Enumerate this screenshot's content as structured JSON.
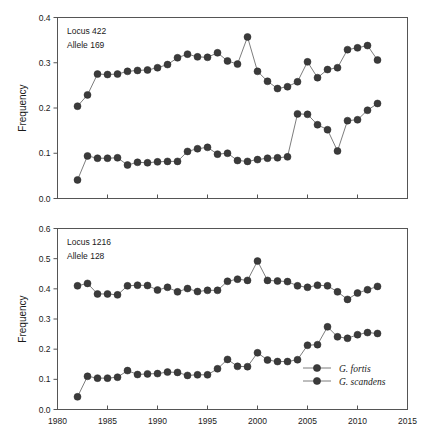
{
  "figure": {
    "background": "#ffffff",
    "marker_color": "#3b3b3b",
    "line_color": "#6e6e6e",
    "axis_color": "#555555"
  },
  "chart_data": [
    {
      "type": "line",
      "panel": "top",
      "title": "",
      "annotation_line1": "Locus 422",
      "annotation_line2": "Allele 169",
      "xlabel": "",
      "ylabel": "Frequency",
      "xlim": [
        1980,
        2015
      ],
      "ylim": [
        0.0,
        0.4
      ],
      "xticks": [
        1980,
        1985,
        1990,
        1995,
        2000,
        2005,
        2010,
        2015
      ],
      "xticklabels": [
        "1980",
        "1985",
        "1990",
        "1995",
        "2000",
        "2005",
        "2010",
        "2015"
      ],
      "yticks": [
        0.0,
        0.1,
        0.2,
        0.3,
        0.4
      ],
      "yticklabels": [
        "0.0",
        "0.1",
        "0.2",
        "0.3",
        "0.4"
      ],
      "grid": false,
      "legend": null,
      "x": [
        1982,
        1983,
        1984,
        1985,
        1986,
        1987,
        1988,
        1989,
        1990,
        1991,
        1992,
        1993,
        1994,
        1995,
        1996,
        1997,
        1998,
        1999,
        2000,
        2001,
        2002,
        2003,
        2004,
        2005,
        2006,
        2007,
        2008,
        2009,
        2010,
        2011,
        2012
      ],
      "series": [
        {
          "name": "G. fortis",
          "values": [
            0.204,
            0.229,
            0.275,
            0.274,
            0.275,
            0.281,
            0.283,
            0.284,
            0.289,
            0.296,
            0.311,
            0.319,
            0.313,
            0.312,
            0.322,
            0.304,
            0.297,
            0.357,
            0.281,
            0.259,
            0.243,
            0.247,
            0.258,
            0.302,
            0.267,
            0.285,
            0.289,
            0.329,
            0.333,
            0.338,
            0.306,
            0.272,
            0.271,
            0.279
          ]
        },
        {
          "name": "G. scandens",
          "values": [
            0.041,
            0.094,
            0.089,
            0.089,
            0.09,
            0.074,
            0.08,
            0.079,
            0.081,
            0.082,
            0.082,
            0.104,
            0.11,
            0.113,
            0.098,
            0.1,
            0.084,
            0.082,
            0.086,
            0.089,
            0.09,
            0.092,
            0.187,
            0.186,
            0.163,
            0.152,
            0.105,
            0.172,
            0.174,
            0.195,
            0.21,
            0.219,
            0.221,
            0.194,
            0.173
          ]
        }
      ]
    },
    {
      "type": "line",
      "panel": "bottom",
      "title": "",
      "annotation_line1": "Locus 1216",
      "annotation_line2": "Allele 128",
      "xlabel": "",
      "ylabel": "Frequency",
      "xlim": [
        1980,
        2015
      ],
      "ylim": [
        0.0,
        0.6
      ],
      "xticks": [
        1980,
        1985,
        1990,
        1995,
        2000,
        2005,
        2010,
        2015
      ],
      "xticklabels": [
        "1980",
        "1985",
        "1990",
        "1995",
        "2000",
        "2005",
        "2010",
        "2015"
      ],
      "yticks": [
        0.0,
        0.1,
        0.2,
        0.3,
        0.4,
        0.5,
        0.6
      ],
      "yticklabels": [
        "0.0",
        "0.1",
        "0.2",
        "0.3",
        "0.4",
        "0.5",
        "0.6"
      ],
      "grid": false,
      "legend": {
        "position": "lower-right",
        "entries": [
          "G. fortis",
          "G. scandens"
        ]
      },
      "x": [
        1982,
        1983,
        1984,
        1985,
        1986,
        1987,
        1988,
        1989,
        1990,
        1991,
        1992,
        1993,
        1994,
        1995,
        1996,
        1997,
        1998,
        1999,
        2000,
        2001,
        2002,
        2003,
        2004,
        2005,
        2006,
        2007,
        2008,
        2009,
        2010,
        2011,
        2012
      ],
      "series": [
        {
          "name": "G. fortis",
          "values": [
            0.41,
            0.418,
            0.383,
            0.383,
            0.38,
            0.41,
            0.412,
            0.411,
            0.396,
            0.405,
            0.39,
            0.401,
            0.391,
            0.395,
            0.395,
            0.425,
            0.432,
            0.428,
            0.492,
            0.428,
            0.426,
            0.424,
            0.41,
            0.405,
            0.412,
            0.41,
            0.39,
            0.365,
            0.386,
            0.397,
            0.408
          ]
        },
        {
          "name": "G. scandens",
          "values": [
            0.042,
            0.11,
            0.104,
            0.104,
            0.107,
            0.129,
            0.116,
            0.118,
            0.119,
            0.124,
            0.123,
            0.113,
            0.115,
            0.115,
            0.135,
            0.166,
            0.143,
            0.142,
            0.188,
            0.164,
            0.159,
            0.159,
            0.165,
            0.213,
            0.215,
            0.274,
            0.241,
            0.236,
            0.248,
            0.255,
            0.252
          ]
        }
      ]
    }
  ]
}
